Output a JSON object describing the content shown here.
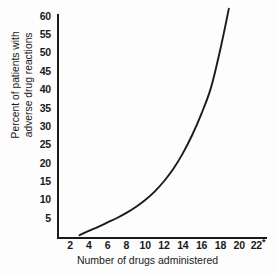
{
  "chart_data": {
    "type": "line",
    "title": "",
    "subtitle": "",
    "xlabel": "Number of drugs administered",
    "ylabel_line1": "Percent of patients with",
    "ylabel_line2": "adverse drug reactions",
    "ylabel": "Percent of patients with adverse drug reactions",
    "xlim": [
      0,
      23
    ],
    "ylim": [
      0,
      62
    ],
    "xticks": [
      2,
      4,
      6,
      8,
      10,
      12,
      14,
      16,
      18,
      20,
      22
    ],
    "xtick_labels": [
      "2",
      "4",
      "6",
      "8",
      "10",
      "12",
      "14",
      "16",
      "18",
      "20",
      "22"
    ],
    "x_axis_footnote_marker": "*",
    "yticks": [
      5,
      10,
      15,
      20,
      25,
      30,
      35,
      40,
      45,
      50,
      55,
      60
    ],
    "ytick_labels": [
      "5",
      "10",
      "15",
      "20",
      "25",
      "30",
      "35",
      "40",
      "45",
      "50",
      "55",
      "60"
    ],
    "grid": false,
    "legend": false,
    "legend_position": "none",
    "line_color": "#1a1a1a",
    "background_color": "#fdfdfd",
    "series": [
      {
        "name": "Percent of patients with adverse drug reactions",
        "x": [
          3.0,
          4.0,
          5.0,
          6.0,
          7.0,
          8.0,
          9.0,
          10.0,
          11.0,
          12.0,
          13.0,
          14.0,
          15.0,
          16.0,
          17.0,
          18.0,
          18.9
        ],
        "values": [
          0.3,
          1.5,
          2.6,
          3.8,
          5.0,
          6.4,
          8.0,
          9.9,
          12.2,
          15.0,
          18.4,
          22.6,
          27.6,
          33.5,
          40.5,
          51.0,
          62.0
        ]
      }
    ],
    "annotations": []
  },
  "axis": {
    "y_title_line1": "Percent of patients with",
    "y_title_line2": "adverse drug reactions",
    "x_title": "Number of drugs administered"
  }
}
